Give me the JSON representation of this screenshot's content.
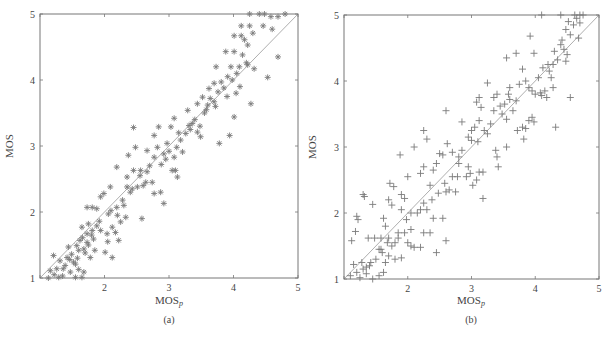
{
  "chart_data": [
    {
      "type": "scatter",
      "panel": "(a)",
      "caption": "(a)",
      "xlabel": "MOS",
      "xlabel_sub": "p",
      "ylabel": "MOS",
      "xlim": [
        1,
        5
      ],
      "ylim": [
        1,
        5
      ],
      "xticks": [
        "2",
        "3",
        "4",
        "5"
      ],
      "yticks": [
        "1",
        "2",
        "3",
        "4",
        "5"
      ],
      "marker": "asterisk",
      "marker_color": "#7a7a7a",
      "reference_line": "y = x",
      "grid": false,
      "points": [
        [
          1.29,
          1.01
        ],
        [
          1.13,
          1.0
        ],
        [
          1.16,
          1.11
        ],
        [
          1.26,
          1.14
        ],
        [
          1.39,
          1.19
        ],
        [
          1.47,
          1.09
        ],
        [
          1.55,
          1.01
        ],
        [
          1.65,
          1.01
        ],
        [
          1.68,
          1.09
        ],
        [
          1.31,
          1.26
        ],
        [
          1.42,
          1.31
        ],
        [
          1.55,
          1.21
        ],
        [
          1.49,
          1.36
        ],
        [
          1.6,
          1.42
        ],
        [
          1.68,
          1.44
        ],
        [
          1.78,
          1.31
        ],
        [
          1.21,
          1.34
        ],
        [
          1.44,
          1.47
        ],
        [
          1.62,
          1.57
        ],
        [
          1.73,
          1.54
        ],
        [
          1.83,
          1.59
        ],
        [
          1.65,
          1.77
        ],
        [
          1.75,
          1.82
        ],
        [
          1.88,
          1.79
        ],
        [
          1.94,
          1.72
        ],
        [
          2.04,
          1.67
        ],
        [
          2.12,
          1.77
        ],
        [
          1.73,
          1.67
        ],
        [
          1.81,
          1.72
        ],
        [
          2.01,
          1.39
        ],
        [
          2.12,
          1.31
        ],
        [
          2.22,
          1.57
        ],
        [
          2.17,
          1.69
        ],
        [
          2.25,
          1.85
        ],
        [
          2.33,
          1.92
        ],
        [
          2.19,
          2.07
        ],
        [
          2.06,
          1.97
        ],
        [
          1.88,
          2.05
        ],
        [
          1.73,
          2.07
        ],
        [
          1.81,
          2.07
        ],
        [
          1.94,
          2.23
        ],
        [
          1.99,
          2.28
        ],
        [
          2.09,
          2.38
        ],
        [
          2.19,
          2.68
        ],
        [
          2.35,
          2.38
        ],
        [
          2.43,
          2.35
        ],
        [
          2.51,
          2.38
        ],
        [
          2.35,
          2.53
        ],
        [
          2.45,
          2.63
        ],
        [
          2.56,
          2.63
        ],
        [
          2.66,
          2.61
        ],
        [
          2.37,
          2.86
        ],
        [
          2.48,
          2.98
        ],
        [
          2.45,
          3.28
        ],
        [
          2.58,
          1.9
        ],
        [
          2.64,
          2.45
        ],
        [
          2.77,
          2.28
        ],
        [
          2.87,
          2.3
        ],
        [
          2.92,
          2.13
        ],
        [
          2.74,
          2.45
        ],
        [
          2.66,
          2.93
        ],
        [
          2.77,
          2.83
        ],
        [
          2.82,
          2.98
        ],
        [
          2.84,
          3.29
        ],
        [
          2.77,
          3.16
        ],
        [
          2.92,
          2.88
        ],
        [
          2.97,
          3.04
        ],
        [
          3.08,
          2.83
        ],
        [
          3.03,
          3.29
        ],
        [
          3.08,
          3.42
        ],
        [
          3.05,
          2.63
        ],
        [
          3.13,
          2.53
        ],
        [
          3.1,
          2.63
        ],
        [
          3.21,
          2.91
        ],
        [
          3.18,
          3.09
        ],
        [
          3.26,
          3.19
        ],
        [
          3.31,
          3.31
        ],
        [
          3.36,
          3.34
        ],
        [
          3.44,
          3.21
        ],
        [
          3.49,
          3.14
        ],
        [
          3.78,
          3.04
        ],
        [
          3.94,
          3.16
        ],
        [
          4.01,
          3.44
        ],
        [
          4.27,
          3.64
        ],
        [
          3.6,
          3.62
        ],
        [
          3.7,
          3.67
        ],
        [
          3.29,
          3.54
        ],
        [
          3.44,
          3.64
        ],
        [
          3.52,
          3.74
        ],
        [
          3.62,
          3.87
        ],
        [
          3.7,
          3.95
        ],
        [
          3.81,
          3.97
        ],
        [
          3.91,
          4.05
        ],
        [
          4.04,
          3.8
        ],
        [
          3.73,
          4.2
        ],
        [
          3.96,
          4.2
        ],
        [
          4.09,
          4.2
        ],
        [
          4.22,
          4.23
        ],
        [
          4.32,
          4.17
        ],
        [
          4.53,
          4.04
        ],
        [
          4.69,
          4.35
        ],
        [
          3.88,
          4.43
        ],
        [
          4.01,
          4.43
        ],
        [
          4.14,
          4.38
        ],
        [
          4.22,
          4.53
        ],
        [
          4.17,
          4.61
        ],
        [
          4.01,
          4.67
        ],
        [
          4.12,
          4.67
        ],
        [
          4.3,
          4.71
        ],
        [
          4.12,
          4.82
        ],
        [
          4.25,
          4.82
        ],
        [
          4.46,
          4.82
        ],
        [
          4.6,
          4.77
        ],
        [
          4.25,
          5.0
        ],
        [
          4.4,
          5.0
        ],
        [
          4.48,
          5.0
        ],
        [
          4.58,
          4.96
        ],
        [
          4.69,
          4.96
        ],
        [
          4.8,
          5.0
        ],
        [
          1.36,
          1.14
        ],
        [
          1.52,
          1.24
        ],
        [
          1.58,
          1.3
        ],
        [
          1.7,
          1.38
        ],
        [
          1.57,
          1.49
        ],
        [
          1.66,
          1.61
        ],
        [
          1.8,
          1.65
        ],
        [
          1.92,
          1.86
        ],
        [
          2.1,
          2.02
        ],
        [
          2.28,
          2.18
        ],
        [
          2.4,
          2.3
        ],
        [
          2.55,
          2.55
        ],
        [
          2.7,
          2.7
        ],
        [
          2.88,
          2.72
        ],
        [
          3.0,
          2.92
        ],
        [
          3.15,
          3.2
        ],
        [
          3.33,
          3.25
        ],
        [
          3.4,
          3.4
        ],
        [
          3.55,
          3.5
        ],
        [
          3.64,
          3.72
        ],
        [
          3.76,
          3.82
        ],
        [
          3.85,
          3.88
        ],
        [
          3.98,
          4.0
        ],
        [
          4.05,
          4.1
        ],
        [
          4.2,
          4.26
        ],
        [
          1.22,
          1.05
        ],
        [
          1.35,
          1.03
        ],
        [
          1.6,
          1.13
        ],
        [
          1.46,
          1.28
        ],
        [
          1.75,
          1.5
        ],
        [
          1.85,
          1.42
        ],
        [
          2.05,
          1.55
        ],
        [
          2.2,
          1.95
        ],
        [
          2.3,
          2.1
        ],
        [
          2.6,
          2.4
        ],
        [
          2.95,
          2.8
        ],
        [
          3.12,
          2.98
        ],
        [
          3.48,
          3.3
        ],
        [
          3.58,
          3.55
        ],
        [
          3.72,
          3.6
        ],
        [
          3.9,
          3.75
        ],
        [
          4.1,
          3.9
        ]
      ]
    },
    {
      "type": "scatter",
      "panel": "(b)",
      "caption": "(b)",
      "xlabel": "MOS",
      "xlabel_sub": "p",
      "ylabel": "MOS",
      "xlim": [
        1,
        5
      ],
      "ylim": [
        1,
        5
      ],
      "xticks": [
        "2",
        "3",
        "4",
        "5"
      ],
      "yticks": [
        "1",
        "2",
        "3",
        "4",
        "5"
      ],
      "marker": "plus",
      "marker_color": "#7a7a7a",
      "reference_line": "y = x",
      "grid": false,
      "points": [
        [
          1.1,
          1.05
        ],
        [
          1.2,
          1.1
        ],
        [
          1.25,
          1.02
        ],
        [
          1.3,
          1.15
        ],
        [
          1.35,
          1.08
        ],
        [
          1.4,
          1.2
        ],
        [
          1.28,
          1.25
        ],
        [
          1.15,
          1.22
        ],
        [
          1.45,
          1.0
        ],
        [
          1.55,
          1.05
        ],
        [
          1.62,
          1.1
        ],
        [
          1.5,
          1.3
        ],
        [
          1.6,
          1.4
        ],
        [
          1.7,
          1.35
        ],
        [
          1.8,
          1.3
        ],
        [
          1.9,
          1.32
        ],
        [
          1.12,
          1.58
        ],
        [
          1.18,
          1.72
        ],
        [
          1.22,
          1.9
        ],
        [
          1.2,
          1.95
        ],
        [
          1.3,
          2.28
        ],
        [
          1.32,
          2.25
        ],
        [
          1.45,
          2.13
        ],
        [
          1.38,
          1.62
        ],
        [
          1.48,
          1.62
        ],
        [
          1.58,
          1.62
        ],
        [
          1.65,
          1.8
        ],
        [
          1.62,
          1.92
        ],
        [
          1.75,
          1.5
        ],
        [
          1.8,
          1.55
        ],
        [
          1.85,
          1.62
        ],
        [
          1.95,
          1.7
        ],
        [
          2.0,
          1.55
        ],
        [
          2.05,
          1.5
        ],
        [
          2.1,
          1.48
        ],
        [
          2.2,
          1.48
        ],
        [
          2.25,
          1.7
        ],
        [
          2.35,
          1.7
        ],
        [
          2.45,
          1.4
        ],
        [
          2.6,
          1.58
        ],
        [
          2.55,
          1.92
        ],
        [
          2.4,
          1.92
        ],
        [
          2.3,
          2.05
        ],
        [
          2.25,
          2.15
        ],
        [
          2.15,
          2.0
        ],
        [
          2.05,
          2.0
        ],
        [
          1.95,
          2.22
        ],
        [
          1.9,
          2.28
        ],
        [
          1.78,
          2.4
        ],
        [
          1.72,
          2.45
        ],
        [
          1.7,
          2.2
        ],
        [
          1.75,
          2.12
        ],
        [
          1.88,
          2.88
        ],
        [
          2.0,
          2.55
        ],
        [
          2.1,
          3.0
        ],
        [
          2.2,
          2.6
        ],
        [
          2.25,
          2.7
        ],
        [
          2.35,
          2.42
        ],
        [
          2.4,
          2.65
        ],
        [
          2.45,
          2.75
        ],
        [
          2.5,
          2.9
        ],
        [
          2.55,
          2.88
        ],
        [
          2.6,
          2.32
        ],
        [
          2.65,
          2.35
        ],
        [
          2.7,
          2.92
        ],
        [
          2.75,
          2.32
        ],
        [
          2.8,
          2.85
        ],
        [
          2.85,
          2.95
        ],
        [
          2.78,
          2.55
        ],
        [
          2.92,
          2.55
        ],
        [
          2.95,
          2.7
        ],
        [
          2.98,
          2.6
        ],
        [
          3.02,
          2.42
        ],
        [
          3.08,
          2.5
        ],
        [
          3.12,
          2.62
        ],
        [
          3.18,
          2.62
        ],
        [
          3.18,
          2.22
        ],
        [
          2.62,
          3.05
        ],
        [
          2.6,
          3.55
        ],
        [
          2.25,
          3.25
        ],
        [
          2.3,
          3.12
        ],
        [
          2.85,
          3.38
        ],
        [
          2.95,
          3.15
        ],
        [
          3.0,
          3.25
        ],
        [
          3.05,
          3.3
        ],
        [
          3.1,
          3.08
        ],
        [
          3.12,
          3.4
        ],
        [
          3.15,
          3.6
        ],
        [
          3.12,
          3.75
        ],
        [
          3.08,
          3.68
        ],
        [
          3.25,
          3.97
        ],
        [
          3.25,
          3.2
        ],
        [
          3.35,
          3.55
        ],
        [
          3.35,
          3.75
        ],
        [
          3.4,
          3.8
        ],
        [
          3.45,
          3.62
        ],
        [
          3.38,
          2.95
        ],
        [
          3.4,
          2.85
        ],
        [
          3.42,
          2.7
        ],
        [
          3.55,
          3.0
        ],
        [
          3.55,
          3.42
        ],
        [
          3.52,
          3.65
        ],
        [
          3.58,
          3.8
        ],
        [
          3.6,
          3.9
        ],
        [
          3.65,
          3.55
        ],
        [
          3.7,
          3.7
        ],
        [
          3.72,
          3.25
        ],
        [
          3.8,
          3.3
        ],
        [
          3.85,
          3.28
        ],
        [
          3.82,
          3.12
        ],
        [
          3.9,
          3.4
        ],
        [
          3.95,
          3.45
        ],
        [
          3.98,
          3.38
        ],
        [
          3.55,
          4.35
        ],
        [
          3.7,
          4.42
        ],
        [
          3.8,
          4.18
        ],
        [
          3.85,
          4.0
        ],
        [
          3.9,
          3.9
        ],
        [
          3.92,
          4.68
        ],
        [
          3.98,
          4.42
        ],
        [
          3.95,
          3.85
        ],
        [
          4.0,
          3.8
        ],
        [
          4.05,
          4.05
        ],
        [
          4.08,
          3.82
        ],
        [
          4.1,
          3.78
        ],
        [
          4.12,
          4.2
        ],
        [
          4.15,
          3.85
        ],
        [
          4.18,
          3.75
        ],
        [
          4.2,
          4.25
        ],
        [
          4.25,
          4.05
        ],
        [
          4.28,
          3.9
        ],
        [
          4.3,
          4.45
        ],
        [
          4.32,
          3.3
        ],
        [
          4.35,
          4.32
        ],
        [
          4.4,
          4.55
        ],
        [
          4.42,
          4.62
        ],
        [
          4.45,
          4.48
        ],
        [
          4.48,
          4.78
        ],
        [
          4.5,
          4.4
        ],
        [
          4.52,
          4.9
        ],
        [
          4.55,
          3.75
        ],
        [
          4.55,
          4.7
        ],
        [
          4.6,
          4.85
        ],
        [
          4.65,
          4.95
        ],
        [
          4.68,
          4.65
        ],
        [
          4.7,
          4.88
        ],
        [
          4.1,
          5.0
        ],
        [
          4.4,
          5.0
        ],
        [
          4.62,
          5.0
        ],
        [
          4.7,
          5.0
        ],
        [
          4.75,
          5.0
        ],
        [
          4.48,
          4.3
        ],
        [
          4.28,
          4.25
        ],
        [
          4.22,
          4.15
        ],
        [
          3.75,
          3.95
        ],
        [
          3.6,
          3.72
        ],
        [
          3.48,
          3.5
        ],
        [
          3.3,
          3.35
        ],
        [
          3.2,
          3.25
        ],
        [
          3.0,
          3.1
        ],
        [
          2.8,
          2.75
        ],
        [
          2.7,
          2.55
        ],
        [
          2.58,
          2.45
        ],
        [
          2.48,
          2.3
        ],
        [
          2.38,
          2.2
        ],
        [
          2.2,
          2.05
        ],
        [
          1.98,
          1.9
        ],
        [
          1.85,
          1.7
        ],
        [
          1.68,
          1.55
        ],
        [
          1.55,
          1.45
        ],
        [
          1.42,
          1.25
        ],
        [
          1.35,
          1.18
        ],
        [
          1.65,
          1.25
        ],
        [
          1.58,
          1.45
        ],
        [
          1.9,
          2.05
        ],
        [
          2.05,
          1.75
        ],
        [
          1.7,
          1.62
        ]
      ]
    }
  ]
}
